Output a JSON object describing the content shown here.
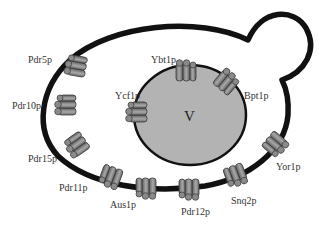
{
  "diagram": {
    "colors": {
      "membrane": "#111111",
      "vacuole_fill": "#b3b3b3",
      "transporter_fill": "#8c8c8c",
      "transporter_stroke": "#3a3a3a",
      "label": "#333333"
    },
    "vacuole": {
      "label": "V"
    },
    "plasma_membrane_transporters": [
      {
        "name": "Pdr5p",
        "label_x": 28,
        "label_y": 63
      },
      {
        "name": "Pdr10p",
        "label_x": 12,
        "label_y": 109
      },
      {
        "name": "Pdr15p",
        "label_x": 28,
        "label_y": 162
      },
      {
        "name": "Pdr11p",
        "label_x": 59,
        "label_y": 191
      },
      {
        "name": "Aus1p",
        "label_x": 110,
        "label_y": 208
      },
      {
        "name": "Pdr12p",
        "label_x": 181,
        "label_y": 215
      },
      {
        "name": "Snq2p",
        "label_x": 231,
        "label_y": 204
      },
      {
        "name": "Yor1p",
        "label_x": 276,
        "label_y": 170
      }
    ],
    "vacuolar_transporters": [
      {
        "name": "Ybt1p",
        "label_x": 151,
        "label_y": 63
      },
      {
        "name": "Bpt1p",
        "label_x": 244,
        "label_y": 99
      },
      {
        "name": "Ycf1p",
        "label_x": 115,
        "label_y": 99
      }
    ]
  }
}
